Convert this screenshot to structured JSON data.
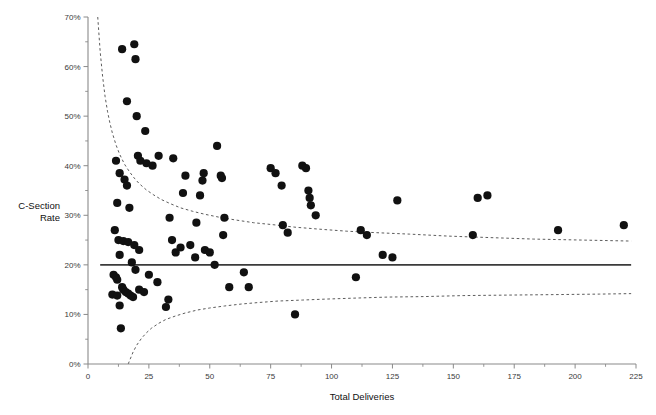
{
  "chart_data": {
    "type": "scatter",
    "title": "",
    "xlabel": "Total Deliveries",
    "ylabel": "C-Section\nRate",
    "ylabel_line1": "C-Section",
    "ylabel_line2": "Rate",
    "xlim": [
      0,
      225
    ],
    "ylim": [
      0,
      70
    ],
    "grid": false,
    "legend": null,
    "xticks": [
      0,
      25,
      50,
      75,
      100,
      125,
      150,
      175,
      200,
      225
    ],
    "xtick_labels": [
      "0",
      "25",
      "50",
      "75",
      "100",
      "125",
      "150",
      "175",
      "200",
      "225"
    ],
    "xticks_minor": [
      12.5,
      37.5,
      62.5,
      87.5,
      112.5,
      137.5,
      162.5,
      187.5,
      212.5
    ],
    "yticks": [
      0,
      10,
      20,
      30,
      40,
      50,
      60,
      70
    ],
    "ytick_labels": [
      "0%",
      "10%",
      "20%",
      "30%",
      "40%",
      "50%",
      "60%",
      "70%"
    ],
    "yticks_minor": [
      5,
      15,
      25,
      35,
      45,
      55,
      65
    ],
    "marker_color": "#111111",
    "marker_size_px": 4.1,
    "center_line": {
      "label": "overall C-section rate",
      "value": 20.0,
      "style": "solid",
      "color": "#3b3b3b",
      "x_start": 5,
      "x_end": 223
    },
    "control_limits": [
      {
        "name": "upper limit",
        "style": "dashed",
        "color": "#4a4a4a",
        "points": [
          [
            4.0,
            70.0
          ],
          [
            5.0,
            63.0
          ],
          [
            6.0,
            58.0
          ],
          [
            7.0,
            54.0
          ],
          [
            8.0,
            51.0
          ],
          [
            9.0,
            48.6
          ],
          [
            10.0,
            46.6
          ],
          [
            11.5,
            44.2
          ],
          [
            13.0,
            42.3
          ],
          [
            15.0,
            40.3
          ],
          [
            17.0,
            38.8
          ],
          [
            19.0,
            37.5
          ],
          [
            21.0,
            36.4
          ],
          [
            24.0,
            35.1
          ],
          [
            27.0,
            34.1
          ],
          [
            30.0,
            33.2
          ],
          [
            34.0,
            32.3
          ],
          [
            38.0,
            31.5
          ],
          [
            43.0,
            30.8
          ],
          [
            48.0,
            30.2
          ],
          [
            54.0,
            29.6
          ],
          [
            60.0,
            29.1
          ],
          [
            68.0,
            28.5
          ],
          [
            76.0,
            28.1
          ],
          [
            85.0,
            27.6
          ],
          [
            95.0,
            27.2
          ],
          [
            106.0,
            26.8
          ],
          [
            118.0,
            26.5
          ],
          [
            132.0,
            26.2
          ],
          [
            148.0,
            25.8
          ],
          [
            165.0,
            25.5
          ],
          [
            183.0,
            25.2
          ],
          [
            203.0,
            25.0
          ],
          [
            223.0,
            24.8
          ]
        ]
      },
      {
        "name": "lower limit",
        "style": "dashed",
        "color": "#4a4a4a",
        "points": [
          [
            16.5,
            0.0
          ],
          [
            17.5,
            1.2
          ],
          [
            18.5,
            2.4
          ],
          [
            20.0,
            3.8
          ],
          [
            22.0,
            5.2
          ],
          [
            24.0,
            6.3
          ],
          [
            26.0,
            7.2
          ],
          [
            29.0,
            8.2
          ],
          [
            32.0,
            9.0
          ],
          [
            36.0,
            9.7
          ],
          [
            40.0,
            10.3
          ],
          [
            45.0,
            10.9
          ],
          [
            50.0,
            11.3
          ],
          [
            56.0,
            11.7
          ],
          [
            63.0,
            12.1
          ],
          [
            70.0,
            12.4
          ],
          [
            78.0,
            12.7
          ],
          [
            88.0,
            12.9
          ],
          [
            98.0,
            13.1
          ],
          [
            110.0,
            13.3
          ],
          [
            123.0,
            13.5
          ],
          [
            138.0,
            13.6
          ],
          [
            154.0,
            13.8
          ],
          [
            172.0,
            13.9
          ],
          [
            192.0,
            14.0
          ],
          [
            210.0,
            14.1
          ],
          [
            223.0,
            14.2
          ]
        ]
      }
    ],
    "points": [
      [
        14.0,
        63.5
      ],
      [
        19.0,
        64.5
      ],
      [
        19.5,
        61.5
      ],
      [
        16.0,
        53.0
      ],
      [
        20.0,
        50.0
      ],
      [
        23.5,
        47.0
      ],
      [
        11.5,
        41.0
      ],
      [
        13.0,
        38.5
      ],
      [
        15.0,
        37.2
      ],
      [
        16.0,
        36.0
      ],
      [
        20.5,
        42.0
      ],
      [
        21.5,
        41.0
      ],
      [
        24.0,
        40.5
      ],
      [
        26.5,
        40.0
      ],
      [
        29.0,
        42.0
      ],
      [
        35.0,
        41.5
      ],
      [
        12.0,
        32.5
      ],
      [
        17.0,
        31.5
      ],
      [
        11.0,
        27.0
      ],
      [
        12.5,
        25.0
      ],
      [
        14.5,
        24.8
      ],
      [
        16.5,
        24.6
      ],
      [
        19.0,
        24.0
      ],
      [
        21.0,
        23.0
      ],
      [
        13.0,
        22.0
      ],
      [
        18.0,
        20.5
      ],
      [
        19.5,
        19.0
      ],
      [
        10.5,
        18.0
      ],
      [
        11.5,
        17.5
      ],
      [
        12.0,
        17.0
      ],
      [
        14.0,
        15.5
      ],
      [
        14.5,
        15.0
      ],
      [
        15.5,
        14.5
      ],
      [
        16.5,
        14.2
      ],
      [
        17.5,
        13.8
      ],
      [
        18.5,
        13.5
      ],
      [
        10.0,
        14.0
      ],
      [
        12.0,
        13.8
      ],
      [
        13.0,
        11.8
      ],
      [
        13.5,
        7.2
      ],
      [
        21.0,
        15.0
      ],
      [
        23.0,
        14.5
      ],
      [
        25.0,
        18.0
      ],
      [
        28.5,
        16.5
      ],
      [
        32.0,
        11.5
      ],
      [
        33.0,
        13.0
      ],
      [
        33.5,
        29.5
      ],
      [
        34.5,
        25.0
      ],
      [
        36.0,
        22.5
      ],
      [
        38.0,
        23.5
      ],
      [
        39.0,
        34.5
      ],
      [
        40.0,
        38.0
      ],
      [
        42.0,
        24.0
      ],
      [
        44.0,
        21.5
      ],
      [
        44.5,
        28.5
      ],
      [
        46.0,
        34.0
      ],
      [
        47.0,
        37.0
      ],
      [
        47.5,
        38.5
      ],
      [
        48.0,
        23.0
      ],
      [
        50.0,
        22.5
      ],
      [
        52.0,
        20.0
      ],
      [
        53.0,
        44.0
      ],
      [
        54.5,
        38.0
      ],
      [
        55.0,
        37.5
      ],
      [
        55.5,
        26.0
      ],
      [
        56.0,
        29.5
      ],
      [
        58.0,
        15.5
      ],
      [
        64.0,
        18.5
      ],
      [
        66.0,
        15.5
      ],
      [
        75.0,
        39.5
      ],
      [
        77.0,
        38.5
      ],
      [
        79.5,
        36.0
      ],
      [
        80.0,
        28.0
      ],
      [
        82.0,
        26.5
      ],
      [
        85.0,
        10.0
      ],
      [
        88.0,
        40.0
      ],
      [
        89.5,
        39.5
      ],
      [
        90.5,
        35.0
      ],
      [
        91.0,
        33.5
      ],
      [
        91.5,
        32.0
      ],
      [
        93.5,
        30.0
      ],
      [
        110.0,
        17.5
      ],
      [
        112.0,
        27.0
      ],
      [
        114.5,
        26.0
      ],
      [
        121.0,
        22.0
      ],
      [
        125.0,
        21.5
      ],
      [
        127.0,
        33.0
      ],
      [
        158.0,
        26.0
      ],
      [
        160.0,
        33.5
      ],
      [
        164.0,
        34.0
      ],
      [
        193.0,
        27.0
      ],
      [
        220.0,
        28.0
      ]
    ]
  }
}
